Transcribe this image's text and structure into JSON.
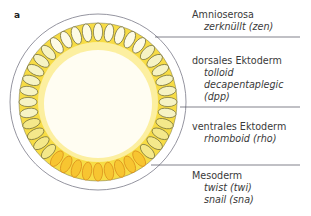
{
  "figure": {
    "panel_label": "a",
    "colors": {
      "outer_membrane": "#7a7a88",
      "yolk_ring": "#f7dc45",
      "inner_glow": "#fdf6c8",
      "cell_amnioserosa": "#fdfbe6",
      "cell_dorsal_ectoderm": "#f6f3c4",
      "cell_ventral_ectoderm": "#f4e88a",
      "cell_mesoderm": "#f7c531",
      "cell_outline": "#6e6a38",
      "cell_outline_mesoderm": "#d98a1a",
      "leader_line": "#4a4a5a"
    },
    "regions": [
      {
        "title": "Amnioserosa",
        "genes": [
          "zerknüllt (zen)"
        ]
      },
      {
        "title": "dorsales Ektoderm",
        "genes": [
          "tolloid",
          "decapentaplegic (dpp)"
        ]
      },
      {
        "title": "ventrales Ektoderm",
        "genes": [
          "rhomboid (rho)"
        ]
      },
      {
        "title": "Mesoderm",
        "genes": [
          "twist (twi)",
          "snail (sna)"
        ]
      }
    ]
  }
}
